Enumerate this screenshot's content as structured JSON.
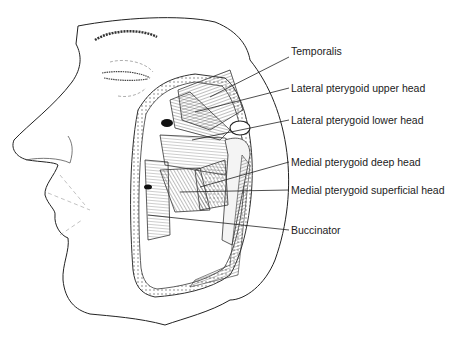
{
  "figure": {
    "labels": [
      {
        "id": "temporalis",
        "text": "Temporalis",
        "x": 291,
        "y": 51
      },
      {
        "id": "lateral-pterygoid-upper",
        "text": "Lateral pterygoid upper head",
        "x": 291,
        "y": 82
      },
      {
        "id": "lateral-pterygoid-lower",
        "text": "Lateral pterygoid lower head",
        "x": 291,
        "y": 114
      },
      {
        "id": "medial-pterygoid-deep",
        "text": "Medial pterygoid deep head",
        "x": 291,
        "y": 156
      },
      {
        "id": "medial-pterygoid-superficial",
        "text": "Medial pterygoid superficial head",
        "x": 291,
        "y": 184
      },
      {
        "id": "buccinator",
        "text": "Buccinator",
        "x": 291,
        "y": 224
      }
    ],
    "line_color": "#222222"
  }
}
